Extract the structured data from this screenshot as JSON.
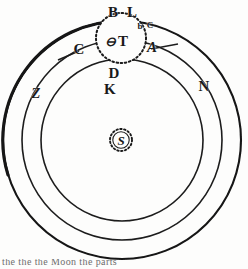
{
  "figure": {
    "width": 248,
    "height": 269,
    "background": "#fdfdfc",
    "ink_color": "#141414"
  },
  "geometry": {
    "center": {
      "x": 122,
      "y": 140
    },
    "orbits": [
      {
        "name": "outer-orbit",
        "radius": 119,
        "stroke_width": 2.0,
        "style": "solid"
      },
      {
        "name": "middle-orbit",
        "radius": 100,
        "stroke_width": 1.5,
        "style": "solid"
      },
      {
        "name": "inner-orbit",
        "radius": 81,
        "stroke_width": 1.5,
        "style": "solid"
      }
    ],
    "epicycle": {
      "name": "epicycle-circle",
      "cx": 121,
      "cy": 38,
      "radius": 25,
      "style": "dotted"
    },
    "sun_marker": {
      "name": "sun-circle",
      "cx": 121,
      "cy": 140,
      "radius": 11,
      "style": "dotted"
    },
    "radial_lines": [
      {
        "name": "radius-line-c",
        "x1": 78,
        "y1": 49,
        "x2": 62,
        "y2": 57
      },
      {
        "name": "radius-line-a",
        "x1": 150,
        "y1": 48,
        "x2": 176,
        "y2": 44
      }
    ]
  },
  "labels": {
    "top_outer": [
      {
        "id": "label-B",
        "text": "B",
        "x": 113,
        "y": 12,
        "size": "major"
      },
      {
        "id": "label-L",
        "text": "L",
        "x": 132,
        "y": 12,
        "size": "major"
      }
    ],
    "epicycle_marks": [
      {
        "id": "label-b",
        "text": "b",
        "x": 140,
        "y": 26,
        "size": "minor"
      },
      {
        "id": "label-G",
        "text": "C",
        "x": 150,
        "y": 25,
        "size": "minor"
      }
    ],
    "bodies": [
      {
        "id": "label-earth-symbol",
        "text": "⊖",
        "x": 110,
        "y": 41,
        "size": "body"
      },
      {
        "id": "label-T",
        "text": "T",
        "x": 122,
        "y": 41,
        "size": "major"
      },
      {
        "id": "label-S",
        "text": "S",
        "x": 121,
        "y": 140,
        "size": "body"
      }
    ],
    "orbit_marks": [
      {
        "id": "label-C",
        "text": "C",
        "x": 79,
        "y": 49,
        "size": "major"
      },
      {
        "id": "label-A",
        "text": "A",
        "x": 152,
        "y": 47,
        "size": "major"
      },
      {
        "id": "label-D",
        "text": "D",
        "x": 114,
        "y": 73,
        "size": "major"
      },
      {
        "id": "label-K",
        "text": "K",
        "x": 110,
        "y": 89,
        "size": "major"
      },
      {
        "id": "label-Z",
        "text": "Z",
        "x": 36,
        "y": 93,
        "size": "major"
      },
      {
        "id": "label-N",
        "text": "N",
        "x": 204,
        "y": 86,
        "size": "major"
      }
    ]
  },
  "caption": {
    "text": "the the the Moon the parts"
  }
}
